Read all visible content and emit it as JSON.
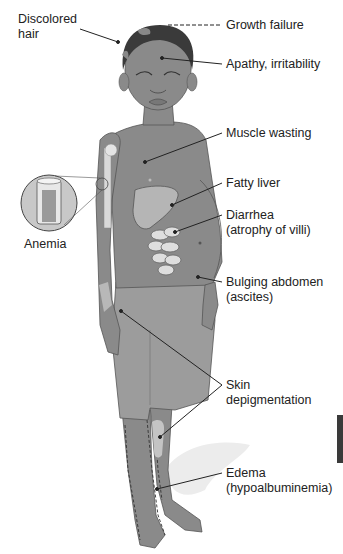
{
  "figure": {
    "labels": {
      "discolored_hair": [
        "Discolored",
        "hair"
      ],
      "growth_failure": "Growth failure",
      "apathy": "Apathy, irritability",
      "muscle_wasting": "Muscle wasting",
      "anemia": "Anemia",
      "fatty_liver": "Fatty liver",
      "diarrhea": [
        "Diarrhea",
        "(atrophy of villi)"
      ],
      "bulging_abdomen": [
        "Bulging abdomen",
        "(ascites)"
      ],
      "skin_depigmentation": [
        "Skin",
        "depigmentation"
      ],
      "edema": [
        "Edema",
        "(hypoalbuminemia)"
      ]
    },
    "colors": {
      "skin": "#8a8a8a",
      "skin_dark": "#6e6e6e",
      "shorts": "#9c9c9c",
      "depigmented": "#c4c4c4",
      "hair": "#3a3a3a",
      "organ": "#b5b5b5",
      "intestine": "#dedede",
      "leader_line": "#222222",
      "text": "#222222"
    }
  }
}
